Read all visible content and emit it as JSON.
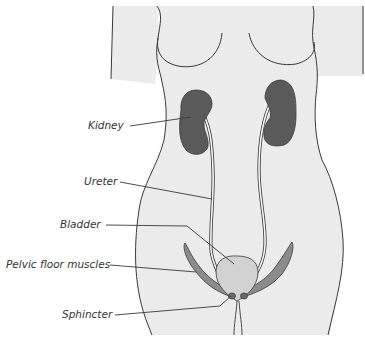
{
  "diagram": {
    "colors": {
      "body_fill": "#ececec",
      "outline": "#3a3a3a",
      "kidney": "#5a5a5a",
      "bladder": "#d2d2d2",
      "muscle": "#8c8c8c",
      "leader": "#3a3a3a",
      "label_text": "#333333"
    },
    "labels": [
      {
        "id": "kidney",
        "text": "Kidney"
      },
      {
        "id": "ureter",
        "text": "Ureter"
      },
      {
        "id": "bladder",
        "text": "Bladder"
      },
      {
        "id": "pelvic-floor-muscles",
        "text": "Pelvic floor muscles"
      },
      {
        "id": "sphincter",
        "text": "Sphincter"
      }
    ]
  }
}
